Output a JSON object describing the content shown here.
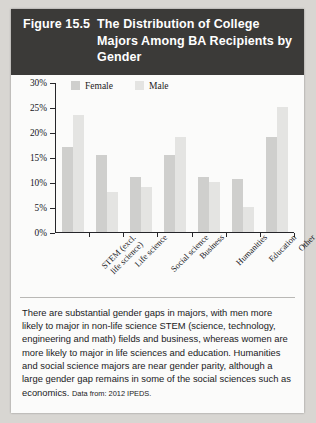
{
  "header": {
    "figure_number": "Figure 15.5",
    "title": "The Distribution of College Majors Among BA Recipients by Gender"
  },
  "chart_data": {
    "type": "bar",
    "title": "The Distribution of College Majors Among BA Recipients by Gender",
    "xlabel": "",
    "ylabel": "",
    "ylim": [
      0,
      30
    ],
    "grid": false,
    "legend_position": "top-left",
    "ytick_labels": [
      "30%",
      "25%",
      "20%",
      "15%",
      "10%",
      "5%",
      "0%"
    ],
    "ytick_values": [
      30,
      25,
      20,
      15,
      10,
      5,
      0
    ],
    "categories": [
      "STEM (excl.\nlife science)",
      "Life science",
      "Social science",
      "Business",
      "Humanities",
      "Education",
      "Other"
    ],
    "series": [
      {
        "name": "Female",
        "color": "#cfcfcd",
        "values": [
          17,
          15.5,
          11,
          15.5,
          11,
          10.5,
          19
        ]
      },
      {
        "name": "Male",
        "color": "#e4e4e2",
        "values": [
          23.5,
          8,
          9,
          19,
          10,
          5,
          25
        ]
      }
    ]
  },
  "caption": {
    "body": "There are substantial gender gaps in majors, with men more likely to major in non-life science STEM (science, technology, engineering and math) fields and business, whereas women are more likely to major in life sciences and education. Humanities and social science majors are near gender parity, although a large gender gap remains in some of the social sciences such as economics.",
    "source": "Data from: 2012 IPEDS."
  }
}
